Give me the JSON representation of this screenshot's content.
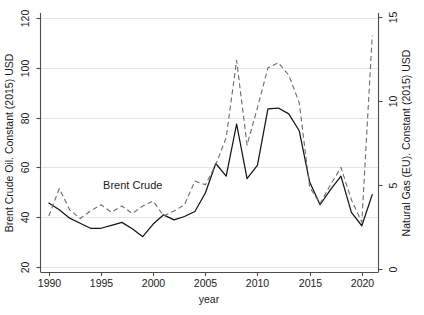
{
  "chart_data": {
    "type": "line",
    "title": "",
    "xlabel": "year",
    "ylabel": "Brent Crude Oil. Constant (2015) USD",
    "y2label": "Natural Gas (EU). Constant (2015) USD",
    "xlim": [
      1989.2,
      2021.6
    ],
    "ylim": [
      18.0,
      122.0
    ],
    "y2lim": [
      -0.15,
      15.25
    ],
    "xticks": [
      1990,
      1995,
      2000,
      2005,
      2010,
      2015,
      2020
    ],
    "xtick_labels": [
      "1990",
      "1995",
      "2000",
      "2005",
      "2010",
      "2015",
      "2020"
    ],
    "yticks": [
      20,
      40,
      60,
      80,
      100,
      120
    ],
    "ytick_labels": [
      "20",
      "40",
      "60",
      "80",
      "100",
      "120"
    ],
    "y2ticks": [
      0,
      5,
      10,
      15
    ],
    "y2tick_labels": [
      "0",
      "5",
      "10",
      "15"
    ],
    "grid": true,
    "grid_axis": "y",
    "legend_position": "inline-annotations",
    "annotations": [
      {
        "text": "Brent Crude",
        "x": 1995.2,
        "y": 51.5,
        "series": "Brent Crude"
      },
      {
        "text": "Natural Gas",
        "x": 1999.0,
        "y": 21.5,
        "series": "Natural Gas"
      }
    ],
    "series": [
      {
        "name": "Natural Gas",
        "axis": "right",
        "style": "solid",
        "color": "#141414",
        "units": "Constant (2015) USD",
        "x": [
          1990,
          1991,
          1992,
          1993,
          1994,
          1995,
          1996,
          1997,
          1998,
          1999,
          2000,
          2001,
          2002,
          2003,
          2004,
          2005,
          2006,
          2007,
          2008,
          2009,
          2010,
          2011,
          2012,
          2013,
          2014,
          2015,
          2016,
          2017,
          2018,
          2019,
          2020,
          2021
        ],
        "values": [
          3.95,
          3.55,
          3.05,
          2.75,
          2.45,
          2.45,
          2.62,
          2.8,
          2.42,
          1.95,
          2.7,
          3.25,
          2.95,
          3.15,
          3.45,
          4.55,
          6.3,
          5.55,
          8.65,
          5.4,
          6.2,
          9.55,
          9.6,
          9.25,
          8.25,
          5.2,
          3.85,
          4.75,
          5.55,
          3.4,
          2.6,
          4.45
        ]
      },
      {
        "name": "Brent Crude",
        "axis": "left",
        "style": "dashed",
        "color": "#6b6b6b",
        "units": "Constant (2015) USD",
        "x": [
          1990,
          1991,
          1992,
          1993,
          1994,
          1995,
          1996,
          1997,
          1998,
          1999,
          2000,
          2001,
          2002,
          2003,
          2004,
          2005,
          2006,
          2007,
          2008,
          2009,
          2010,
          2011,
          2012,
          2013,
          2014,
          2015,
          2016,
          2017,
          2018,
          2019,
          2020,
          2021
        ],
        "values": [
          40.5,
          51.5,
          43.0,
          39.5,
          42.5,
          45.0,
          42.0,
          44.5,
          41.5,
          44.5,
          46.5,
          40.5,
          42.5,
          45.0,
          54.5,
          53.0,
          61.0,
          72.0,
          103.0,
          69.0,
          84.0,
          100.0,
          102.0,
          97.0,
          86.0,
          52.0,
          45.5,
          53.0,
          60.0,
          47.0,
          38.0,
          113.0
        ]
      }
    ]
  },
  "axes": {
    "left_title": "Brent Crude Oil. Constant (2015) USD",
    "right_title": "Natural Gas (EU). Constant (2015) USD",
    "x_title": "year"
  }
}
